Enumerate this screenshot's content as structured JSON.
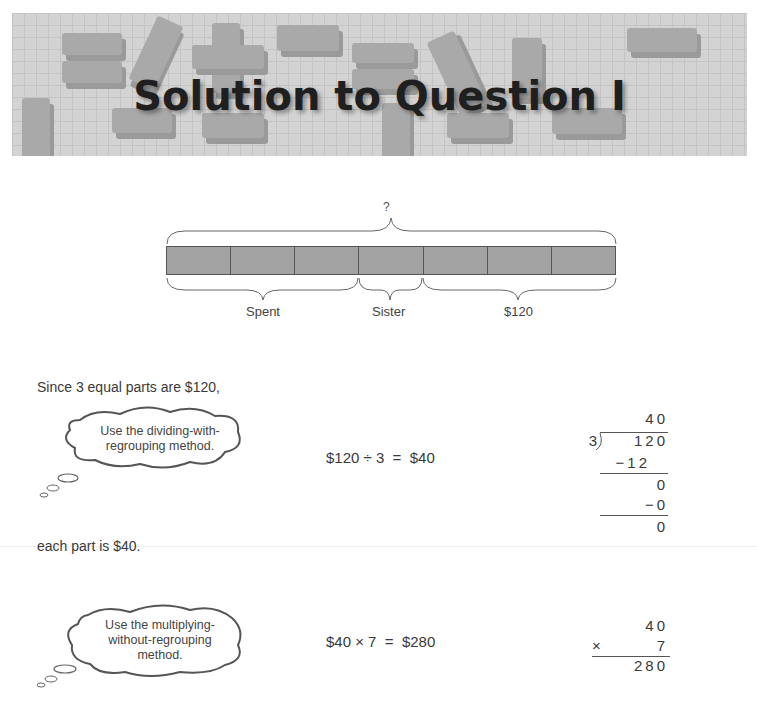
{
  "banner": {
    "title": "Solution to Question I"
  },
  "bar_model": {
    "total_label": "?",
    "units": 7,
    "labels": {
      "spent": "Spent",
      "sister": "Sister",
      "remaining": "$120"
    }
  },
  "step1": {
    "intro": "Since 3 equal parts are $120,",
    "tip": [
      "Use the dividing-with-",
      "regrouping method."
    ],
    "equation": "$120 ÷ 3  =  $40",
    "long_division": {
      "quotient": "40",
      "divisor": "3",
      "dividend": "120",
      "sub1": "−12",
      "rem1": "0",
      "sub2": "−0",
      "rem2": "0"
    },
    "conclusion": "each part is $40."
  },
  "step2": {
    "tip": [
      "Use the multiplying-",
      "without-regrouping",
      "method."
    ],
    "equation": "$40 × 7  =  $280",
    "multiplication": {
      "top": "40",
      "op": "×",
      "multiplier": "7",
      "result": "280"
    }
  }
}
